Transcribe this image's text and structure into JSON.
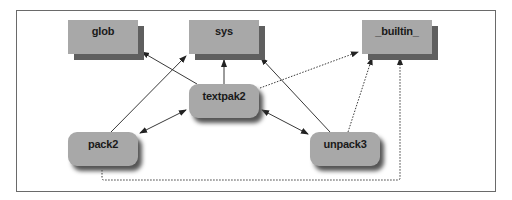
{
  "diagram": {
    "type": "module dependency graph",
    "nodes": [
      {
        "id": "glob",
        "label": "glob",
        "shape": "rectangle"
      },
      {
        "id": "sys",
        "label": "sys",
        "shape": "rectangle"
      },
      {
        "id": "builtin",
        "label": "_builtin_",
        "shape": "rectangle"
      },
      {
        "id": "textpak2",
        "label": "textpak2",
        "shape": "rounded"
      },
      {
        "id": "pack2",
        "label": "pack2",
        "shape": "rounded"
      },
      {
        "id": "unpack3",
        "label": "unpack3",
        "shape": "rounded"
      }
    ],
    "edges": [
      {
        "from": "textpak2",
        "to": "glob",
        "style": "solid",
        "direction": "forward"
      },
      {
        "from": "textpak2",
        "to": "sys",
        "style": "solid",
        "direction": "forward"
      },
      {
        "from": "textpak2",
        "to": "builtin",
        "style": "dotted",
        "direction": "forward"
      },
      {
        "from": "pack2",
        "to": "sys",
        "style": "solid",
        "direction": "forward"
      },
      {
        "from": "pack2",
        "to": "textpak2",
        "style": "solid",
        "direction": "both"
      },
      {
        "from": "unpack3",
        "to": "textpak2",
        "style": "solid",
        "direction": "both"
      },
      {
        "from": "unpack3",
        "to": "sys",
        "style": "solid",
        "direction": "forward"
      },
      {
        "from": "unpack3",
        "to": "builtin",
        "style": "dotted",
        "direction": "forward"
      },
      {
        "from": "pack2",
        "to": "builtin",
        "style": "dotted",
        "direction": "forward"
      }
    ]
  },
  "colors": {
    "node_fill": "#a8a8a8",
    "node_shadow": "#5f5f5f",
    "line": "#222222",
    "frame": "#6a6a6a"
  }
}
